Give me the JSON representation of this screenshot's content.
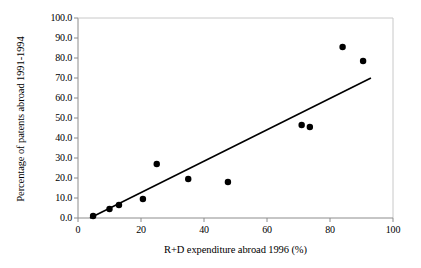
{
  "chart_data": {
    "type": "scatter",
    "title": "",
    "xlabel": "R+D expenditure abroad 1996 (%)",
    "ylabel": "Percentage of patents abroad 1991-1994",
    "xlim": [
      0,
      100
    ],
    "ylim": [
      0.0,
      100.0
    ],
    "xticks": [
      "0",
      "20",
      "40",
      "60",
      "80",
      "100"
    ],
    "xtick_values": [
      0,
      20,
      40,
      60,
      80,
      100
    ],
    "yticks": [
      "0.0",
      "10.0",
      "20.0",
      "30.0",
      "40.0",
      "50.0",
      "60.0",
      "70.0",
      "80.0",
      "90.0",
      "100.0"
    ],
    "ytick_values": [
      0,
      10,
      20,
      30,
      40,
      50,
      60,
      70,
      80,
      90,
      100
    ],
    "grid": false,
    "legend": null,
    "marker_color": "#000000",
    "marker_size": 5,
    "line_color": "#000000",
    "frame_color": "#808080",
    "series": [
      {
        "name": "Countries",
        "type": "scatter",
        "points": [
          {
            "x": 4.8,
            "y": 1.0
          },
          {
            "x": 10.0,
            "y": 4.5
          },
          {
            "x": 13.0,
            "y": 6.5
          },
          {
            "x": 20.6,
            "y": 9.5
          },
          {
            "x": 25.0,
            "y": 27.0
          },
          {
            "x": 35.0,
            "y": 19.5
          },
          {
            "x": 47.6,
            "y": 18.0
          },
          {
            "x": 71.0,
            "y": 46.5
          },
          {
            "x": 73.6,
            "y": 45.5
          },
          {
            "x": 84.0,
            "y": 85.5
          },
          {
            "x": 90.5,
            "y": 78.5
          }
        ]
      },
      {
        "name": "Trend line",
        "type": "line",
        "points": [
          {
            "x": 3.8,
            "y": 0.0
          },
          {
            "x": 93.0,
            "y": 70.0
          }
        ]
      }
    ]
  }
}
